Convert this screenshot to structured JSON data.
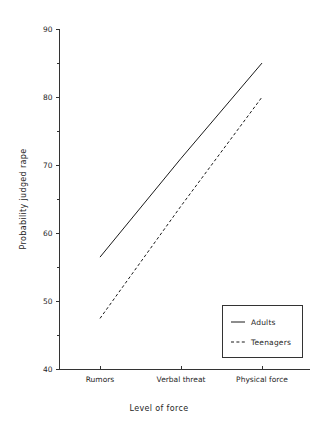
{
  "chart_data": {
    "type": "line",
    "title": "",
    "xlabel": "Level of force",
    "ylabel": "Probability judged rape",
    "categories": [
      "Rumors",
      "Verbal threat",
      "Physical force"
    ],
    "series": [
      {
        "name": "Adults",
        "style": "solid",
        "values": [
          56.5,
          71.0,
          85.0
        ]
      },
      {
        "name": "Teenagers",
        "style": "dashed",
        "values": [
          47.5,
          64.0,
          80.0
        ]
      }
    ],
    "ylim": [
      40,
      90
    ],
    "ytick_labels": [
      "40",
      "50",
      "60",
      "70",
      "80",
      "90"
    ],
    "ytick_values": [
      40,
      50,
      60,
      70,
      80,
      90
    ],
    "yminor_values": [
      45,
      55,
      65,
      75,
      85
    ],
    "grid": false,
    "legend_position": "bottom-right",
    "legend_entries": [
      "Adults",
      "Teenagers"
    ],
    "line_color": "#1a1a1a",
    "axis_color": "#333333",
    "background_color": "#ffffff"
  }
}
